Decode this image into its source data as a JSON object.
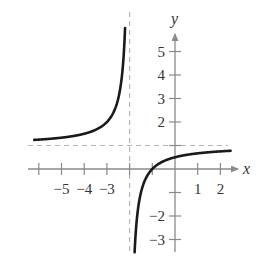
{
  "chart_data": {
    "type": "line",
    "title": "",
    "function": "y = (x + 1) / (x + 2)",
    "xlabel": "x",
    "ylabel": "y",
    "xlim": [
      -6.2,
      2.5
    ],
    "ylim": [
      -3.4,
      5.6
    ],
    "grid": false,
    "legend": null,
    "x_ticks": [
      -6,
      -5,
      -4,
      -3,
      -2,
      -1,
      0,
      1,
      2
    ],
    "x_tick_labels": [
      {
        "value": -5,
        "label": "−5"
      },
      {
        "value": -4,
        "label": "−4"
      },
      {
        "value": -3,
        "label": "−3"
      },
      {
        "value": 1,
        "label": "1"
      },
      {
        "value": 2,
        "label": "2"
      }
    ],
    "y_ticks": [
      -3,
      -2,
      -1,
      1,
      2,
      3,
      4,
      5
    ],
    "y_tick_labels": [
      {
        "value": 5,
        "label": "5"
      },
      {
        "value": 4,
        "label": "4"
      },
      {
        "value": 3,
        "label": "3"
      },
      {
        "value": 2,
        "label": "2"
      },
      {
        "value": -2,
        "label": "−2"
      },
      {
        "value": -3,
        "label": "−3"
      }
    ],
    "asymptotes": {
      "vertical": {
        "x": -2,
        "style": "dashed"
      },
      "horizontal": {
        "y": 1,
        "style": "dashed"
      }
    },
    "series": [
      {
        "name": "left branch",
        "x": [
          -6.2,
          -6,
          -5,
          -4,
          -3,
          -2.5,
          -2.25,
          -2.2
        ],
        "y": [
          1.24,
          1.25,
          1.33,
          1.5,
          2.0,
          3.0,
          5.0,
          6.0
        ]
      },
      {
        "name": "right branch",
        "x": [
          -1.78,
          -1.75,
          -1.5,
          -1,
          0,
          1,
          2,
          2.5
        ],
        "y": [
          -3.5,
          -3.0,
          -1.0,
          0.0,
          0.5,
          0.67,
          0.75,
          0.78
        ]
      }
    ],
    "color": "#1a1a1a"
  }
}
